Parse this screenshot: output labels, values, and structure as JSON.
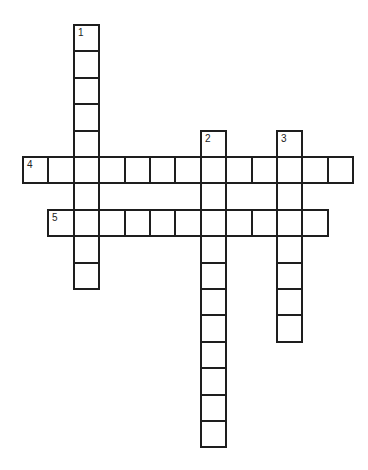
{
  "puzzle": {
    "type": "crossword",
    "grid": {
      "origin_x": 22,
      "origin_y": 24,
      "cell_width": 25.4,
      "cell_height": 26.4,
      "line_color": "#1e1e1e",
      "background": "#ffffff"
    },
    "entries": [
      {
        "number": "1",
        "direction": "down",
        "row": 0,
        "col": 2,
        "length": 10
      },
      {
        "number": "2",
        "direction": "down",
        "row": 4,
        "col": 7,
        "length": 12
      },
      {
        "number": "3",
        "direction": "down",
        "row": 4,
        "col": 10,
        "length": 8
      },
      {
        "number": "4",
        "direction": "across",
        "row": 5,
        "col": 0,
        "length": 13
      },
      {
        "number": "5",
        "direction": "across",
        "row": 7,
        "col": 1,
        "length": 11
      }
    ]
  }
}
